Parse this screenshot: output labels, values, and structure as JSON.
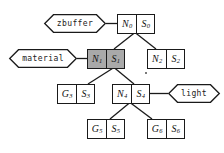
{
  "diagram": {
    "type": "tree-diagram",
    "colors": {
      "stroke": "#1a1a1a",
      "box_fill": "#ffffff",
      "shaded_fill": "#a9a9a9",
      "background": "#ffffff",
      "text": "#111111"
    },
    "nodes": [
      {
        "id": "n0",
        "left": "N",
        "left_sub": "0",
        "right": "S",
        "right_sub": "0",
        "shaded": false,
        "x": 117,
        "y": 14
      },
      {
        "id": "n1",
        "left": "N",
        "left_sub": "1",
        "right": "S",
        "right_sub": "1",
        "shaded": true,
        "x": 87,
        "y": 49
      },
      {
        "id": "n2",
        "left": "N",
        "left_sub": "2",
        "right": "S",
        "right_sub": "2",
        "shaded": false,
        "x": 147,
        "y": 49
      },
      {
        "id": "n3",
        "left": "G",
        "left_sub": "3",
        "right": "S",
        "right_sub": "3",
        "shaded": false,
        "x": 57,
        "y": 84
      },
      {
        "id": "n4",
        "left": "N",
        "left_sub": "4",
        "right": "S",
        "right_sub": "4",
        "shaded": false,
        "x": 112,
        "y": 84
      },
      {
        "id": "n5",
        "left": "G",
        "left_sub": "5",
        "right": "S",
        "right_sub": "5",
        "shaded": false,
        "x": 87,
        "y": 119
      },
      {
        "id": "n6",
        "left": "G",
        "left_sub": "6",
        "right": "S",
        "right_sub": "6",
        "shaded": false,
        "x": 147,
        "y": 119
      }
    ],
    "hexagons": [
      {
        "id": "zbuffer",
        "label": "zbuffer",
        "x": 44,
        "y": 14,
        "width": 62,
        "height": 19,
        "attached_to": "n0"
      },
      {
        "id": "material",
        "label": "material",
        "x": 9,
        "y": 49,
        "width": 68,
        "height": 19,
        "attached_to": "n1"
      },
      {
        "id": "light",
        "label": "light",
        "x": 168,
        "y": 84,
        "width": 52,
        "height": 19,
        "attached_to": "n4"
      }
    ],
    "edges": [
      {
        "from": "zbuffer",
        "to": "n0",
        "kind": "attachment"
      },
      {
        "from": "material",
        "to": "n1",
        "kind": "attachment"
      },
      {
        "from": "n4",
        "to": "light",
        "kind": "attachment"
      },
      {
        "from": "n0",
        "to": "n1",
        "kind": "child"
      },
      {
        "from": "n0",
        "to": "n2",
        "kind": "child"
      },
      {
        "from": "n1",
        "to": "n3",
        "kind": "child"
      },
      {
        "from": "n1",
        "to": "n4",
        "kind": "child"
      },
      {
        "from": "n4",
        "to": "n5",
        "kind": "child"
      },
      {
        "from": "n4",
        "to": "n6",
        "kind": "child"
      }
    ]
  }
}
